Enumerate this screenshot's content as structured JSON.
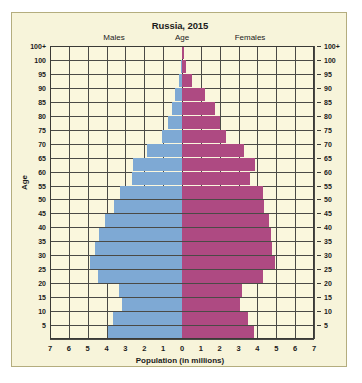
{
  "chart_data": {
    "type": "bar",
    "subtype": "population-pyramid",
    "title": "Russia, 2015",
    "xlabel": "Population (in millions)",
    "ylabel": "Age",
    "panel_labels": {
      "left": "Males",
      "center": "Age",
      "right": "Females"
    },
    "grid": true,
    "legend": "none",
    "xlim": [
      -7,
      7
    ],
    "x_ticks": [
      "7",
      "6",
      "5",
      "4",
      "3",
      "2",
      "1",
      "0",
      "1",
      "2",
      "3",
      "4",
      "5",
      "6",
      "7"
    ],
    "x_tick_values": [
      -7,
      -6,
      -5,
      -4,
      -3,
      -2,
      -1,
      0,
      1,
      2,
      3,
      4,
      5,
      6,
      7
    ],
    "categories": [
      "100+",
      "100",
      "95",
      "90",
      "85",
      "80",
      "75",
      "70",
      "65",
      "60",
      "55",
      "50",
      "45",
      "40",
      "35",
      "30",
      "25",
      "20",
      "15",
      "10",
      "5"
    ],
    "y_ticks_left": [
      "100+",
      "100",
      "95",
      "90",
      "85",
      "80",
      "75",
      "70",
      "65",
      "60",
      "55",
      "50",
      "45",
      "40",
      "35",
      "30",
      "25",
      "20",
      "15",
      "10",
      "5"
    ],
    "y_ticks_right": [
      "100+",
      "100",
      "95",
      "90",
      "85",
      "80",
      "75",
      "70",
      "65",
      "60",
      "55",
      "50",
      "45",
      "40",
      "35",
      "30",
      "25",
      "20",
      "15",
      "10",
      "5"
    ],
    "colors": {
      "males": "#7ea9d4",
      "females": "#ae4a82",
      "background": "#f7f4da",
      "grid": "#4a4a46"
    },
    "series": [
      {
        "name": "Males",
        "side": "left",
        "color": "#7ea9d4",
        "values": [
          0.02,
          0.05,
          0.15,
          0.35,
          0.55,
          0.75,
          1.05,
          1.85,
          2.6,
          2.65,
          3.3,
          3.6,
          4.1,
          4.4,
          4.6,
          4.9,
          4.45,
          3.35,
          3.2,
          3.65,
          3.95
        ]
      },
      {
        "name": "Females",
        "side": "right",
        "color": "#ae4a82",
        "values": [
          0.08,
          0.2,
          0.55,
          1.2,
          1.75,
          2.0,
          2.35,
          3.3,
          3.85,
          3.6,
          4.3,
          4.35,
          4.6,
          4.7,
          4.75,
          4.95,
          4.3,
          3.2,
          3.05,
          3.5,
          3.8
        ]
      }
    ]
  }
}
